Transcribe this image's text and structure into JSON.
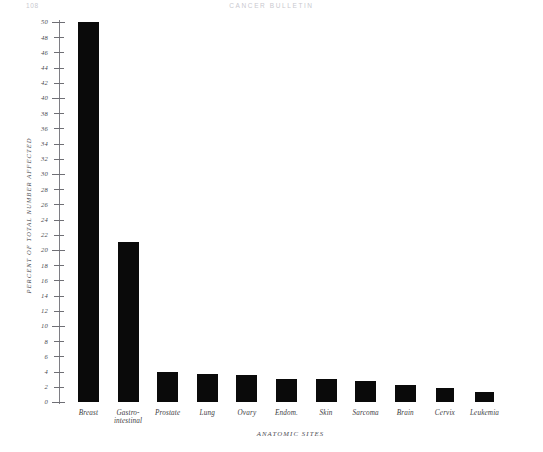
{
  "page": {
    "folio": "108",
    "running_title": "CANCER  BULLETIN"
  },
  "chart_data": {
    "type": "bar",
    "title": "",
    "xlabel": "ANATOMIC SITES",
    "ylabel": "PERCENT OF TOTAL NUMBER AFFECTED",
    "ylim": [
      0,
      50
    ],
    "ytick_step": 2,
    "grid": false,
    "legend": "none",
    "bar_color": "#0a0a0a",
    "categories": [
      "Breast",
      "Gastro-\nintestinal",
      "Prostate",
      "Lung",
      "Ovary",
      "Endom.",
      "Skin",
      "Sarcoma",
      "Brain",
      "Cervix",
      "Leukemia"
    ],
    "values": [
      50,
      21,
      4,
      3.7,
      3.6,
      3,
      3,
      2.8,
      2.3,
      1.8,
      1.3
    ],
    "yticks": [
      0,
      2,
      4,
      6,
      8,
      10,
      12,
      14,
      16,
      18,
      20,
      22,
      24,
      26,
      28,
      30,
      32,
      34,
      36,
      38,
      40,
      42,
      44,
      46,
      48,
      50
    ],
    "ytick_labels": [
      "0",
      "2",
      "4",
      "6",
      "8",
      "10",
      "12",
      "14",
      "16",
      "18",
      "20",
      "22",
      "24",
      "26",
      "28",
      "30",
      "32",
      "34",
      "36",
      "38",
      "40",
      "42",
      "44",
      "46",
      "48",
      "50"
    ]
  }
}
